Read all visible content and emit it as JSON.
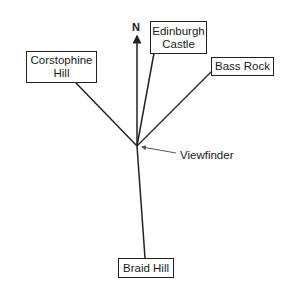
{
  "diagram": {
    "type": "direction-finder",
    "north_label": "N",
    "center_label": "Viewfinder",
    "landmarks": [
      {
        "name": "Edinburgh Castle",
        "lines": [
          "Edinburgh",
          "Castle"
        ]
      },
      {
        "name": "Corstophine Hill",
        "lines": [
          "Corstophine",
          "Hill"
        ]
      },
      {
        "name": "Bass Rock",
        "lines": [
          "Bass Rock"
        ]
      },
      {
        "name": "Braid Hill",
        "lines": [
          "Braid Hill"
        ]
      }
    ],
    "colors": {
      "line": "#222222",
      "background": "#ffffff",
      "text": "#1a1a1a"
    }
  }
}
